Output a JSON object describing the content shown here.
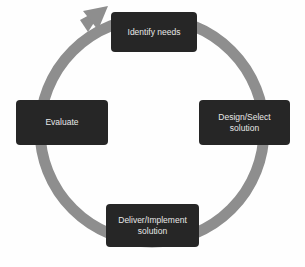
{
  "diagram": {
    "type": "cycle",
    "ring_color": "#8e8e8e",
    "box_color": "#262626",
    "text_color": "#e8e8e8",
    "nodes": [
      {
        "id": "identify",
        "label": "Identify needs",
        "position": "top"
      },
      {
        "id": "design",
        "label": "Design/Select\nsolution",
        "position": "right"
      },
      {
        "id": "deliver",
        "label": "Deliver/Implement\nsolution",
        "position": "bottom"
      },
      {
        "id": "evaluate",
        "label": "Evaluate",
        "position": "left"
      }
    ],
    "edges": [
      {
        "from": "identify",
        "to": "design"
      },
      {
        "from": "design",
        "to": "deliver"
      },
      {
        "from": "deliver",
        "to": "evaluate"
      },
      {
        "from": "evaluate",
        "to": "identify",
        "arrowhead": true
      }
    ]
  }
}
